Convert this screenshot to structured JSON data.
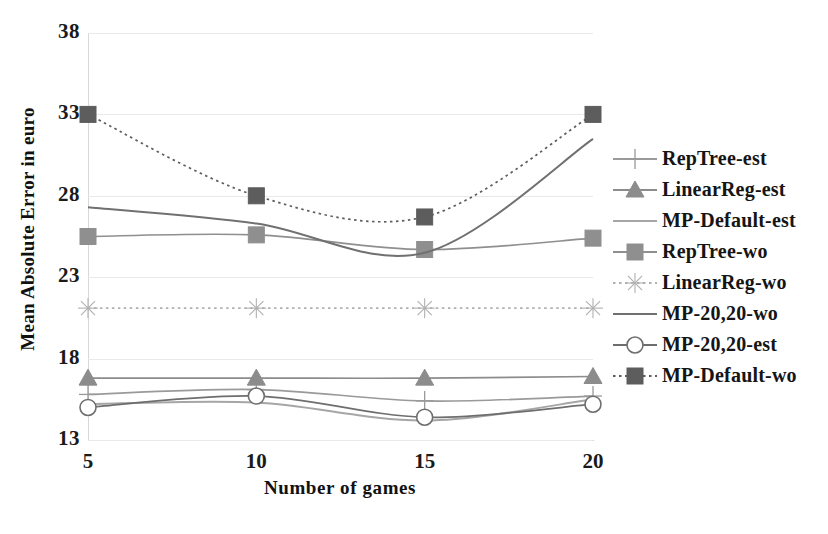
{
  "axes": {
    "x_title": "Number of games",
    "y_title": "Mean Absolute Error in euro",
    "x_ticks": [
      "5",
      "10",
      "15",
      "20"
    ],
    "y_ticks": [
      "38",
      "33",
      "28",
      "23",
      "18",
      "13"
    ]
  },
  "legend": {
    "items": [
      {
        "label": "RepTree-est",
        "marker": "plus-marker",
        "dash": "solid",
        "color": "#9a9a9a"
      },
      {
        "label": "LinearReg-est",
        "marker": "triangle-marker",
        "dash": "solid",
        "color": "#8c8c8c"
      },
      {
        "label": "MP-Default-est",
        "marker": "none-marker",
        "dash": "solid",
        "color": "#a6a6a6"
      },
      {
        "label": "RepTree-wo",
        "marker": "square-marker",
        "dash": "solid",
        "color": "#8f8f8f"
      },
      {
        "label": "LinearReg-wo",
        "marker": "star-marker",
        "dash": "dotted",
        "color": "#b0b0b0"
      },
      {
        "label": "MP-20,20-wo",
        "marker": "none-marker",
        "dash": "solid",
        "color": "#707070"
      },
      {
        "label": "MP-20,20-est",
        "marker": "circle-marker",
        "dash": "solid",
        "color": "#6e6e6e"
      },
      {
        "label": "MP-Default-wo",
        "marker": "square-marker",
        "dash": "dotted",
        "color": "#5d5d5d"
      }
    ]
  },
  "chart_data": {
    "type": "line",
    "title": "",
    "xlabel": "Number of games",
    "ylabel": "Mean Absolute Error in euro",
    "x": [
      5,
      10,
      15,
      20
    ],
    "xlim": [
      5,
      20
    ],
    "ylim": [
      13,
      38
    ],
    "y_ticks": [
      13,
      18,
      23,
      28,
      33,
      38
    ],
    "grid": true,
    "legend_position": "right",
    "series": [
      {
        "name": "RepTree-est",
        "values": [
          15.8,
          16.1,
          15.4,
          15.7
        ],
        "marker": "plus",
        "dash": "solid",
        "color": "#9a9a9a"
      },
      {
        "name": "LinearReg-est",
        "values": [
          16.8,
          16.8,
          16.8,
          16.9
        ],
        "marker": "triangle",
        "dash": "solid",
        "color": "#8c8c8c"
      },
      {
        "name": "MP-Default-est",
        "values": [
          15.2,
          15.3,
          14.2,
          15.5
        ],
        "marker": "none",
        "dash": "solid",
        "color": "#a6a6a6"
      },
      {
        "name": "RepTree-wo",
        "values": [
          25.5,
          25.6,
          24.7,
          25.4
        ],
        "marker": "square",
        "dash": "solid",
        "color": "#8f8f8f"
      },
      {
        "name": "LinearReg-wo",
        "values": [
          21.1,
          21.1,
          21.1,
          21.1
        ],
        "marker": "star",
        "dash": "dotted",
        "color": "#b0b0b0"
      },
      {
        "name": "MP-20,20-wo",
        "values": [
          27.3,
          26.3,
          24.5,
          31.5
        ],
        "marker": "none",
        "dash": "solid",
        "color": "#707070"
      },
      {
        "name": "MP-20,20-est",
        "values": [
          15.0,
          15.7,
          14.4,
          15.2
        ],
        "marker": "circle",
        "dash": "solid",
        "color": "#6e6e6e"
      },
      {
        "name": "MP-Default-wo",
        "values": [
          33.0,
          28.0,
          26.7,
          33.0
        ],
        "marker": "square",
        "dash": "dotted",
        "color": "#5d5d5d"
      }
    ]
  }
}
